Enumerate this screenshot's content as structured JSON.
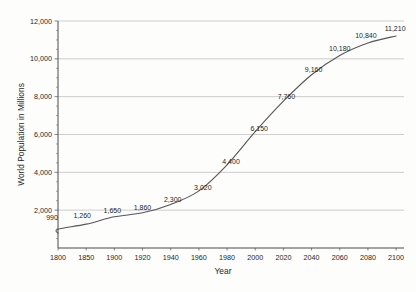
{
  "chart_data": {
    "type": "line",
    "title": "",
    "xlabel": "Year",
    "ylabel": "World Population in Millions",
    "grid": true,
    "legend": "none",
    "xlim": [
      1790,
      2105
    ],
    "ylim": [
      0,
      12000
    ],
    "x_ticks": [
      "1800",
      "1850",
      "1900",
      "1920",
      "1940",
      "1960",
      "1980",
      "2000",
      "2020",
      "2040",
      "2060",
      "2080",
      "2100"
    ],
    "x_tick_values": [
      1800,
      1850,
      1900,
      1920,
      1940,
      1960,
      1980,
      2000,
      2020,
      2040,
      2060,
      2080,
      2100
    ],
    "y_ticks": [
      "2,000",
      "4,000",
      "6,000",
      "8,000",
      "10,000",
      "12,000"
    ],
    "y_tick_values": [
      2000,
      4000,
      6000,
      8000,
      10000,
      12000
    ],
    "x": [
      1800,
      1850,
      1900,
      1920,
      1940,
      1960,
      1980,
      2000,
      2020,
      2040,
      2060,
      2080,
      2100
    ],
    "values": [
      990,
      1260,
      1650,
      1860,
      2300,
      3020,
      4400,
      6150,
      7760,
      9160,
      10180,
      10840,
      11210
    ],
    "point_labels": [
      "990",
      "1,260",
      "1,650",
      "1,860",
      "2,300",
      "3,020",
      "4,400",
      "6,150",
      "7,760",
      "9,160",
      "10,180",
      "10,840",
      "11,210"
    ],
    "series": [
      {
        "name": "World Population",
        "values": [
          990,
          1260,
          1650,
          1860,
          2300,
          3020,
          4400,
          6150,
          7760,
          9160,
          10180,
          10840,
          11210
        ]
      }
    ],
    "colors": {
      "curve": "#55555a",
      "gridline": "#b9b9b9",
      "axis": "#4a4a4a",
      "background": "#fdfdfc",
      "text": "#262626"
    }
  }
}
